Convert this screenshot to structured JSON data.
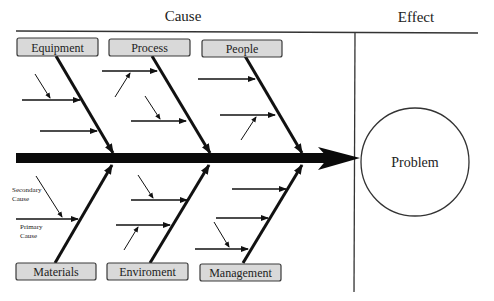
{
  "headings": {
    "cause": "Cause",
    "effect": "Effect"
  },
  "effect": {
    "label": "Problem"
  },
  "categories": {
    "top": [
      {
        "label": "Equipment"
      },
      {
        "label": "Process"
      },
      {
        "label": "People"
      }
    ],
    "bottom": [
      {
        "label": "Materials"
      },
      {
        "label": "Enviroment"
      },
      {
        "label": "Management"
      }
    ]
  },
  "annotations": {
    "secondary_line1": "Secondary",
    "secondary_line2": "Cause",
    "primary_line1": "Primary",
    "primary_line2": "Cause"
  },
  "colors": {
    "box_fill": "#d9d9d9",
    "box_stroke": "#3a3a3a",
    "line": "#111111",
    "frame": "#333333"
  }
}
